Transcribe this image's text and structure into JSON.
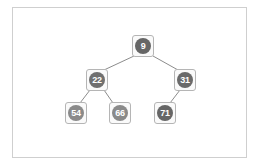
{
  "tree": {
    "nodes": [
      {
        "id": "n9",
        "label": "9",
        "x": 132,
        "y": 35,
        "color": "#666666"
      },
      {
        "id": "n22",
        "label": "22",
        "x": 86,
        "y": 69,
        "color": "#707070"
      },
      {
        "id": "n31",
        "label": "31",
        "x": 174,
        "y": 69,
        "color": "#6a6a6a"
      },
      {
        "id": "n54",
        "label": "54",
        "x": 65,
        "y": 102,
        "color": "#8a8a8a"
      },
      {
        "id": "n66",
        "label": "66",
        "x": 109,
        "y": 102,
        "color": "#8a8a8a"
      },
      {
        "id": "n71",
        "label": "71",
        "x": 154,
        "y": 102,
        "color": "#666666"
      }
    ],
    "edges": [
      [
        "n9",
        "n22"
      ],
      [
        "n9",
        "n31"
      ],
      [
        "n22",
        "n54"
      ],
      [
        "n22",
        "n66"
      ],
      [
        "n31",
        "n71"
      ]
    ],
    "colors": {
      "edge": "#8c8c8c",
      "border": "#b5b5b5",
      "frame": "#cfcfcf"
    }
  }
}
